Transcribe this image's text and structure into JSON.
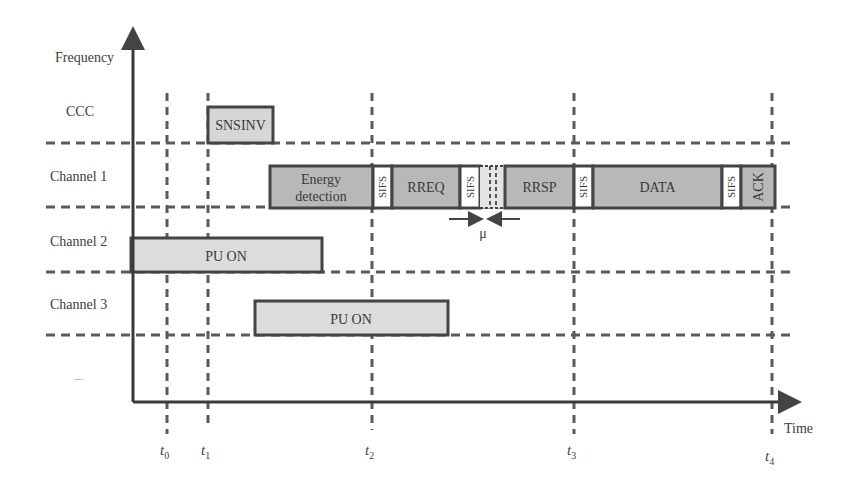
{
  "diagram": {
    "type": "timing-diagram",
    "axes": {
      "y_label": "Frequency",
      "x_label": "Time"
    },
    "rows": [
      {
        "label": "CCC"
      },
      {
        "label": "Channel 1"
      },
      {
        "label": "Channel 2"
      },
      {
        "label": "Channel 3"
      },
      {
        "label": "...."
      }
    ],
    "time_markers": [
      {
        "base": "t",
        "sub": "0"
      },
      {
        "base": "t",
        "sub": "1"
      },
      {
        "base": "t",
        "sub": "2"
      },
      {
        "base": "t",
        "sub": "3"
      },
      {
        "base": "t",
        "sub": "4"
      }
    ],
    "blocks": {
      "ccc": {
        "label": "SNSINV"
      },
      "channel1": [
        {
          "label_line1": "Energy",
          "label_line2": "detection"
        },
        {
          "label": "SIFS"
        },
        {
          "label": "RREQ"
        },
        {
          "label": "SIFS"
        },
        {
          "label": "RRSP"
        },
        {
          "label": "SIFS"
        },
        {
          "label": "DATA"
        },
        {
          "label": "SIFS"
        },
        {
          "label": "ACK"
        }
      ],
      "channel2": {
        "label": "PU ON"
      },
      "channel3": {
        "label": "PU ON"
      }
    },
    "gap_annotation": {
      "label": "μ"
    },
    "colors": {
      "block_dark": "#b8b8b8",
      "block_light": "#dcdcdc",
      "sifs_fill": "#ffffff",
      "line": "#4a4a4a",
      "dash": "#5a5a5a"
    }
  }
}
